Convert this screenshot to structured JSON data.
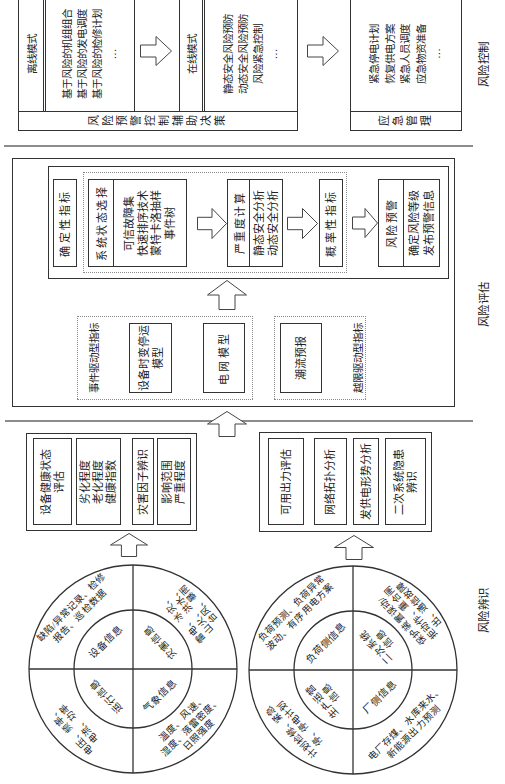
{
  "section_labels": {
    "identification": "风险辨识",
    "assessment": "风险评估",
    "control": "风险控制"
  },
  "control": {
    "decision": {
      "label": "风险预警控制辅助决策",
      "offline": {
        "title": "离线模式",
        "items": [
          "基于风险的机组组合",
          "基于风险的发电调度",
          "基于风险的检修计划",
          "…"
        ]
      },
      "online": {
        "title": "在线模式",
        "items": [
          "静态安全风险预防",
          "动态安全风险预防",
          "风险紧急控制",
          "…"
        ]
      }
    },
    "emergency": {
      "label": "应急管理",
      "items": [
        "紧急停电计划",
        "恢复供电方案",
        "紧急人员调度",
        "应急物资准备",
        "…"
      ]
    }
  },
  "assessment": {
    "deterministic_indicator": "确定性指标",
    "state_selection": {
      "title": "系统状态选择",
      "items": [
        "可信故障集",
        "快速排序技术",
        "蒙特卡洛抽样",
        "事件树"
      ]
    },
    "severity": {
      "title": "严重度计算",
      "items": [
        "静态安全分析",
        "动态安全分析"
      ]
    },
    "probabilistic_indicator": "概率性指标",
    "warning": {
      "title": "风险预警",
      "items": [
        "确定风险等级",
        "发布预警信息"
      ]
    },
    "event_driven": {
      "label": "事件驱动型指标",
      "equipment_model": [
        "设备时变停运",
        "模型"
      ],
      "grid_model": "电网模型"
    },
    "limit_driven": {
      "label": "越限驱动型指标",
      "flow_forecast": "潮流预报"
    }
  },
  "identification": {
    "equipment_group": [
      {
        "lines": [
          "设备健康状态",
          "评估"
        ]
      },
      {
        "lines": [
          "劣化程度",
          "老化程度",
          "健康指数"
        ]
      },
      {
        "lines": [
          "灾害因子辨识"
        ]
      },
      {
        "lines": [
          "影响范围",
          "严重程度"
        ]
      }
    ],
    "grid_group": [
      {
        "lines": [
          "可用出力评估"
        ]
      },
      {
        "lines": [
          "网络拓扑分析"
        ]
      },
      {
        "lines": [
          "发供电形势分析"
        ]
      },
      {
        "lines": [
          "二次系统隐患",
          "辨识"
        ]
      }
    ],
    "equipment_circle": {
      "top_left": {
        "inner": [
          "运行信息"
        ],
        "outer": [
          "电压、频率、",
          "电流、功率"
        ]
      },
      "top_right": {
        "inner": [
          "设备信息"
        ],
        "outer": [
          "缺陷/异常记录、检修",
          "报告、巡检数据"
        ]
      },
      "bottom_left": {
        "inner": [
          "气象信息"
        ],
        "outer": [
          "温度、风速、",
          "湿度、落雷密度、",
          "日照强度"
        ]
      },
      "bottom_right": {
        "inner": [
          "灾害信息"
        ],
        "outer": [
          "雷电、冰灾、",
          "山火、洪水、",
          "台风、暴雨"
        ]
      }
    },
    "grid_circle": {
      "top_left": {
        "inner": [
          "生产运营",
          "信息"
        ],
        "outer": [
          "计划检修、紧急",
          "停、停电计划"
        ]
      },
      "top_right": {
        "inner": [
          "负荷侧信息"
        ],
        "outer": [
          "负荷预测、负荷异常",
          "波动、有序用电方案"
        ]
      },
      "bottom_left": {
        "inner": [
          "厂侧信息"
        ],
        "outer": [
          "电厂存煤、水库来水、",
          "新能源出力预测"
        ]
      },
      "bottom_right": {
        "inner": [
          "二次系统",
          "信息"
        ],
        "outer": [
          "保护装置误动/",
          "拒动作、重合闸",
          "出、通信故障"
        ]
      }
    }
  },
  "colors": {
    "stroke": "#333333",
    "divider": "#8c8c8c",
    "dotted_border": "#8a8a8a",
    "background": "#ffffff"
  }
}
